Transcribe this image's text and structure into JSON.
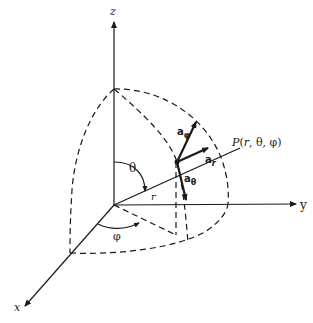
{
  "figure": {
    "axes": {
      "z_label": "z",
      "y_label": "y",
      "x_label": "x"
    },
    "point_label": "P(r, θ, φ)",
    "angle_labels": {
      "theta": "θ",
      "phi": "φ"
    },
    "radius_label": "r",
    "unit_vectors": {
      "a_r": {
        "base": "a",
        "sub": "r"
      },
      "a_theta": {
        "base": "a",
        "sub": "θ"
      },
      "a_phi": {
        "base": "a",
        "sub": "φ"
      }
    },
    "colors": {
      "ink": "#1a1a1a",
      "background": "#ffffff"
    }
  }
}
